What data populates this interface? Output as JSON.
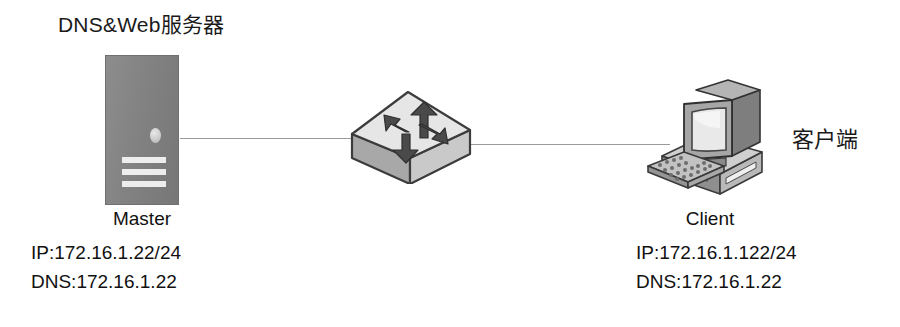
{
  "diagram": {
    "background_color": "#ffffff",
    "line_color": "#9a9a9a",
    "server_color": "#828282",
    "title": "DNS&Web服务器",
    "title_latin": "DNS&Web",
    "title_han": "服务器",
    "client_label_cn": "客户端"
  },
  "server": {
    "icon": "server-tower-icon",
    "caption": "Master",
    "ip": "IP:172.16.1.22/24",
    "dns": "DNS:172.16.1.22"
  },
  "switch": {
    "icon": "network-switch-icon",
    "caption": ""
  },
  "client": {
    "icon": "desktop-computer-icon",
    "caption": "Client",
    "ip": "IP:172.16.1.122/24",
    "dns": "DNS:172.16.1.22"
  },
  "links": [
    {
      "name": "server-to-switch"
    },
    {
      "name": "switch-to-client"
    }
  ]
}
